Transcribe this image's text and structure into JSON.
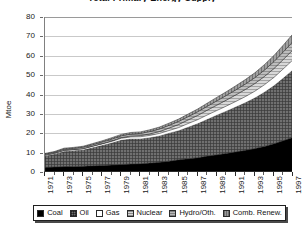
{
  "chart_data": {
    "type": "area",
    "stacked": true,
    "title": "Total Primary Energy Supply",
    "xlabel": "",
    "ylabel": "Mtoe",
    "ylim": [
      0,
      80
    ],
    "yticks": [
      0,
      10,
      20,
      30,
      40,
      50,
      60,
      70,
      80
    ],
    "grid": true,
    "legend_position": "bottom",
    "x": [
      1971,
      1972,
      1973,
      1974,
      1975,
      1976,
      1977,
      1978,
      1979,
      1980,
      1981,
      1982,
      1983,
      1984,
      1985,
      1986,
      1987,
      1988,
      1989,
      1990,
      1991,
      1992,
      1993,
      1994,
      1995,
      1996,
      1997
    ],
    "xtick_labels": [
      "1971",
      "1973",
      "1975",
      "1977",
      "1979",
      "1981",
      "1983",
      "1985",
      "1987",
      "1989",
      "1991",
      "1993",
      "1995",
      "1997"
    ],
    "series": [
      {
        "name": "Coal",
        "color": "#000000",
        "values": [
          2.4,
          2.6,
          2.8,
          2.9,
          3.0,
          3.2,
          3.4,
          3.6,
          3.9,
          4.1,
          4.3,
          4.6,
          5.0,
          5.6,
          6.3,
          6.8,
          7.4,
          8.2,
          8.9,
          9.6,
          10.4,
          11.2,
          12.1,
          13.2,
          14.6,
          16.2,
          17.9
        ]
      },
      {
        "name": "Oil",
        "color": "#6e6e6e",
        "values": [
          6.0,
          6.8,
          8.0,
          8.3,
          8.6,
          9.6,
          10.6,
          11.6,
          12.8,
          13.2,
          13.0,
          13.3,
          13.8,
          14.6,
          15.2,
          16.6,
          17.8,
          19.2,
          20.6,
          22.0,
          23.4,
          24.8,
          26.4,
          28.2,
          30.2,
          32.6,
          35.0
        ]
      },
      {
        "name": "Gas",
        "color": "#ffffff",
        "values": [
          0.3,
          0.3,
          0.4,
          0.4,
          0.4,
          0.5,
          0.5,
          0.6,
          0.7,
          0.8,
          0.9,
          1.0,
          1.1,
          1.2,
          1.4,
          1.6,
          1.8,
          2.0,
          2.2,
          2.4,
          2.6,
          2.9,
          3.2,
          3.6,
          4.0,
          4.5,
          5.0
        ]
      },
      {
        "name": "Nuclear",
        "color": "#d5d5d5",
        "values": [
          0.0,
          0.0,
          0.0,
          0.0,
          0.1,
          0.1,
          0.2,
          0.3,
          0.4,
          0.5,
          0.6,
          0.8,
          1.0,
          1.3,
          1.6,
          1.9,
          2.2,
          2.5,
          2.8,
          3.1,
          3.4,
          3.7,
          4.0,
          4.3,
          4.6,
          4.9,
          5.2
        ]
      },
      {
        "name": "Hydro/Oth.",
        "color": "#b8b8b8",
        "values": [
          0.5,
          0.5,
          0.6,
          0.6,
          0.7,
          0.7,
          0.8,
          0.9,
          0.9,
          1.0,
          1.1,
          1.2,
          1.3,
          1.4,
          1.6,
          1.7,
          1.9,
          2.0,
          2.2,
          2.4,
          2.6,
          2.8,
          3.0,
          3.3,
          3.6,
          3.9,
          4.2
        ]
      },
      {
        "name": "Comb. Renew.",
        "color": "#9a9a9a",
        "values": [
          0.4,
          0.4,
          0.5,
          0.5,
          0.5,
          0.6,
          0.6,
          0.7,
          0.7,
          0.8,
          0.8,
          0.9,
          1.0,
          1.1,
          1.2,
          1.3,
          1.4,
          1.6,
          1.8,
          1.9,
          2.1,
          2.3,
          2.5,
          2.8,
          3.1,
          3.5,
          4.0
        ]
      }
    ]
  },
  "axes": {
    "y_title": "Mtoe",
    "y_labels": [
      "80",
      "70",
      "60",
      "50",
      "40",
      "30",
      "20",
      "10",
      "0"
    ],
    "x_labels": [
      "1971",
      "1973",
      "1975",
      "1977",
      "1979",
      "1981",
      "1983",
      "1985",
      "1987",
      "1989",
      "1991",
      "1993",
      "1995",
      "1997"
    ]
  },
  "legend": {
    "items": [
      {
        "label": "Coal",
        "swatch": "sw-coal"
      },
      {
        "label": "Oil",
        "swatch": "sw-oil"
      },
      {
        "label": "Gas",
        "swatch": "sw-gas"
      },
      {
        "label": "Nuclear",
        "swatch": "sw-nuclear"
      },
      {
        "label": "Hydro/Oth.",
        "swatch": "sw-hydro"
      },
      {
        "label": "Comb. Renew.",
        "swatch": "sw-renew"
      }
    ]
  },
  "title": {
    "text": "Total Primary Energy Supply"
  }
}
